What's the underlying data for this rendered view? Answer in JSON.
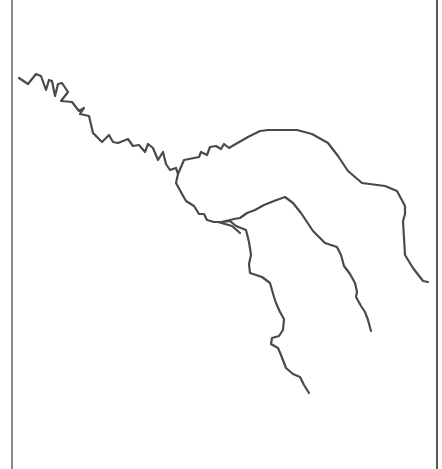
{
  "map": {
    "width": 442,
    "height": 469,
    "background": "#ffffff",
    "frame": {
      "color": "#8a8a8a",
      "right_color": "#555555",
      "left_x": 11,
      "right_x": 436
    },
    "river_style": {
      "color": "#4a4a4a",
      "stroke_width": 2.2
    },
    "rivers": [
      {
        "name": "main-stem",
        "d": "M19,78 L28,84 L36,74 L41,76 L46,90 L49,80 L52,81 L55,96 L58,84 L62,83 L68,92 L61,101 L72,102 L79,111 L84,108 L80,114 L89,116 L93,133 L102,142 L109,135 L113,142 L118,143 L128,139 L133,146 L139,145 L145,152 L148,144 L153,148 L158,160 L163,152 L166,164 L170,170 L176,168 L178,174"
      },
      {
        "name": "north-branch",
        "d": "M178,174 L184,160 L199,157 L201,152 L207,155 L210,147 L216,146 L221,149 L224,144 L229,148 L234,145 L248,137 L260,131 L268,130 L297,130 L312,134 L328,143 L338,156 L348,171 L362,183 L385,186 L397,191 L405,206 L405,214 L403,221 L405,255 L413,268 L423,281 L428,282"
      },
      {
        "name": "southwest-loop",
        "d": "M178,174 L176,183 L182,194 L186,201 L194,206 L199,214 L204,214 L207,220 L214,222 L222,222 L230,221 L236,226 L246,230 L249,242 L251,255 L249,264 L250,273 L262,277 L270,283 L274,297 L276,303 L280,312 L284,319 L283,330 L279,336 L272,338 L271,344 L278,348 L281,355 L286,368 L293,374 L300,377 L304,385 L309,393"
      },
      {
        "name": "middle-branch",
        "d": "M222,222 L234,219 L240,218 L247,213 L255,210 L264,205 L274,201 L285,197 L293,203 L301,213 L313,231 L325,243 L337,247 L341,255 L344,266 L350,274 L355,283 L357,292 L356,297 L361,306 L365,312 L368,320 L371,331"
      },
      {
        "name": "junction-spur",
        "d": "M218,222 L232,226 L240,233"
      }
    ]
  }
}
